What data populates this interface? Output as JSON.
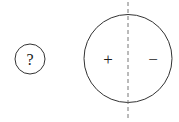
{
  "diagram": {
    "unknown_object": {
      "label": "?"
    },
    "charged_sphere": {
      "left_label": "+",
      "right_label": "−"
    },
    "colors": {
      "stroke": "#333333",
      "dash": "#777777"
    }
  }
}
